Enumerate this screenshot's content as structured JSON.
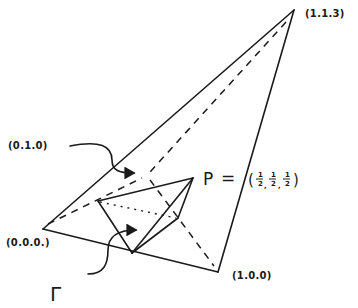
{
  "diagram": {
    "type": "tetrahedron-sketch",
    "vertices": [
      {
        "id": "origin",
        "label": "(0.0.0.)"
      },
      {
        "id": "x",
        "label": "(1.0.0)"
      },
      {
        "id": "y",
        "label": "(0.1.0)"
      },
      {
        "id": "apex",
        "label": "(1.1.3)"
      }
    ],
    "point_p": {
      "name": "P",
      "equals": "=",
      "coords": {
        "open": "(",
        "close": ")",
        "num": [
          "1",
          "1",
          "1"
        ],
        "den": [
          "2",
          "2",
          "2"
        ]
      }
    },
    "region_label": "Γ",
    "annotations": [
      {
        "from": "(0.1.0)",
        "description": "curved arrow pointing to hidden vertex (0,1,0)"
      },
      {
        "from": "Γ",
        "description": "curved arrow pointing to inner tetrahedron region"
      }
    ],
    "colors": {
      "ink": "#1a1a1a",
      "paper": "#ffffff"
    }
  }
}
